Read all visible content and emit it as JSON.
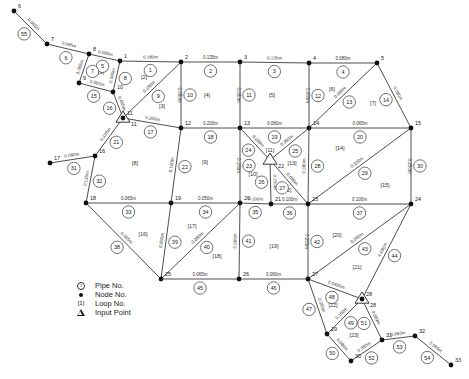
{
  "legend": {
    "pipe_no": "Pipe No.",
    "node_no": "Node No.",
    "loop_no": "Loop No.",
    "input_point": "Input Point",
    "pipe_symbol": "1",
    "loop_symbol": "[1]"
  },
  "nodes": [
    {
      "id": "1",
      "x": 120,
      "y": 61
    },
    {
      "id": "2",
      "x": 181,
      "y": 62
    },
    {
      "id": "3",
      "x": 240,
      "y": 62
    },
    {
      "id": "4",
      "x": 309,
      "y": 63
    },
    {
      "id": "5",
      "x": 377,
      "y": 63
    },
    {
      "id": "6",
      "x": 14,
      "y": 11
    },
    {
      "id": "7",
      "x": 47,
      "y": 44
    },
    {
      "id": "8",
      "x": 89,
      "y": 54
    },
    {
      "id": "9",
      "x": 79,
      "y": 83
    },
    {
      "id": "10",
      "x": 113,
      "y": 92
    },
    {
      "id": "11",
      "x": 123,
      "y": 118
    },
    {
      "id": "12",
      "x": 181,
      "y": 128
    },
    {
      "id": "13",
      "x": 240,
      "y": 128
    },
    {
      "id": "14",
      "x": 309,
      "y": 128
    },
    {
      "id": "15",
      "x": 411,
      "y": 128
    },
    {
      "id": "16",
      "x": 95,
      "y": 156
    },
    {
      "id": "17",
      "x": 50,
      "y": 163
    },
    {
      "id": "18",
      "x": 86,
      "y": 203
    },
    {
      "id": "19",
      "x": 171,
      "y": 203
    },
    {
      "id": "20",
      "x": 240,
      "y": 203
    },
    {
      "id": "21",
      "x": 271,
      "y": 204
    },
    {
      "id": "22",
      "x": 308,
      "y": 204
    },
    {
      "id": "23",
      "x": 308,
      "y": 204
    },
    {
      "id": "24",
      "x": 411,
      "y": 204
    },
    {
      "id": "25",
      "x": 161,
      "y": 279
    },
    {
      "id": "26",
      "x": 239,
      "y": 279
    },
    {
      "id": "27",
      "x": 308,
      "y": 279
    },
    {
      "id": "28",
      "x": 362,
      "y": 299
    },
    {
      "id": "29",
      "x": 327,
      "y": 334
    },
    {
      "id": "30",
      "x": 351,
      "y": 361
    },
    {
      "id": "31",
      "x": 382,
      "y": 340
    },
    {
      "id": "32",
      "x": 415,
      "y": 336
    },
    {
      "id": "33",
      "x": 451,
      "y": 365
    }
  ],
  "pipes": [
    {
      "no": "1",
      "dia": "0.180m",
      "from": "1",
      "to": "2"
    },
    {
      "no": "2",
      "dia": "0.135m",
      "from": "2",
      "to": "3"
    },
    {
      "no": "3",
      "dia": "0.135m",
      "from": "3",
      "to": "4"
    },
    {
      "no": "4",
      "dia": "0.080m",
      "from": "4",
      "to": "5"
    },
    {
      "no": "5",
      "dia": "0.080m",
      "from": "8",
      "to": "1"
    },
    {
      "no": "6",
      "dia": "0.065m",
      "from": "7",
      "to": "8"
    },
    {
      "no": "7",
      "dia": "0.065m",
      "from": "8",
      "to": "9"
    },
    {
      "no": "8",
      "dia": "0.065m",
      "from": "1",
      "to": "10"
    },
    {
      "no": "9",
      "dia": "0.180m",
      "from": "2",
      "to": "11"
    },
    {
      "no": "10",
      "dia": "0.080m",
      "from": "2",
      "to": "12"
    },
    {
      "no": "11",
      "dia": "0.080m",
      "from": "3",
      "to": "13"
    },
    {
      "no": "12",
      "dia": "0.080m",
      "from": "4",
      "to": "14"
    },
    {
      "no": "13",
      "dia": "0.080m",
      "from": "14",
      "to": "5"
    },
    {
      "no": "14",
      "dia": "0.080m",
      "from": "5",
      "to": "15"
    },
    {
      "no": "15",
      "dia": "0.065m",
      "from": "9",
      "to": "10"
    },
    {
      "no": "16",
      "dia": "0.065m",
      "from": "10",
      "to": "11"
    },
    {
      "no": "17",
      "dia": "0.200m",
      "from": "11",
      "to": "12"
    },
    {
      "no": "18",
      "dia": "0.200m",
      "from": "12",
      "to": "13"
    },
    {
      "no": "19",
      "dia": "0.080m",
      "from": "13",
      "to": "14"
    },
    {
      "no": "20",
      "dia": "0.065m",
      "from": "14",
      "to": "15"
    },
    {
      "no": "21",
      "dia": "0.135m",
      "from": "11",
      "to": "16"
    },
    {
      "no": "22",
      "dia": "0.100m",
      "from": "12",
      "to": "19"
    },
    {
      "no": "23",
      "dia": "0.150m",
      "from": "13",
      "to": "20"
    },
    {
      "no": "24",
      "dia": "0.200m",
      "from": "13",
      "to": "22"
    },
    {
      "no": "25",
      "dia": "0.080m",
      "from": "22",
      "to": "14"
    },
    {
      "no": "26",
      "dia": "0.200m",
      "from": "22",
      "to": "21"
    },
    {
      "no": "27",
      "dia": "0.080m",
      "from": "22",
      "to": "23"
    },
    {
      "no": "28",
      "dia": "0.080m",
      "from": "14",
      "to": "23"
    },
    {
      "no": "29",
      "dia": "0.100m",
      "from": "23",
      "to": "15"
    },
    {
      "no": "30",
      "dia": "0.250m",
      "from": "15",
      "to": "24"
    },
    {
      "no": "31",
      "dia": "0.080m",
      "from": "17",
      "to": "16"
    },
    {
      "no": "32",
      "dia": "0.135m",
      "from": "16",
      "to": "18"
    },
    {
      "no": "33",
      "dia": "0.065m",
      "from": "18",
      "to": "19"
    },
    {
      "no": "34",
      "dia": "0.050m",
      "from": "19",
      "to": "20"
    },
    {
      "no": "35",
      "dia": "0.100m",
      "from": "20",
      "to": "21"
    },
    {
      "no": "36",
      "dia": "0.100m",
      "from": "21",
      "to": "23"
    },
    {
      "no": "37",
      "dia": "0.100m",
      "from": "23",
      "to": "24"
    },
    {
      "no": "38",
      "dia": "0.065m",
      "from": "18",
      "to": "25"
    },
    {
      "no": "39",
      "dia": "0.065m",
      "from": "19",
      "to": "25"
    },
    {
      "no": "40",
      "dia": "0.080m",
      "from": "20",
      "to": "25"
    },
    {
      "no": "41",
      "dia": "0.065m",
      "from": "20",
      "to": "26"
    },
    {
      "no": "42",
      "dia": "0.250m",
      "from": "23",
      "to": "27"
    },
    {
      "no": "43",
      "dia": "0.080m",
      "from": "27",
      "to": "24"
    },
    {
      "no": "44",
      "dia": "0.080m",
      "from": "28",
      "to": "24"
    },
    {
      "no": "45",
      "dia": "0.065m",
      "from": "25",
      "to": "26"
    },
    {
      "no": "46",
      "dia": "0.080m",
      "from": "26",
      "to": "27"
    },
    {
      "no": "47",
      "dia": "0.080m",
      "from": "27",
      "to": "29"
    },
    {
      "no": "48",
      "dia": "0.0490m",
      "from": "27",
      "to": "28"
    },
    {
      "no": "49",
      "dia": "0.180m",
      "from": "29",
      "to": "28"
    },
    {
      "no": "50",
      "dia": "0.080m",
      "from": "29",
      "to": "30"
    },
    {
      "no": "51",
      "dia": "0.080m",
      "from": "28",
      "to": "31"
    },
    {
      "no": "52",
      "dia": "0.080m",
      "from": "30",
      "to": "31"
    },
    {
      "no": "53",
      "dia": "0.065m",
      "from": "31",
      "to": "32"
    },
    {
      "no": "54",
      "dia": "0.065m",
      "from": "32",
      "to": "33"
    },
    {
      "no": "55",
      "dia": "0.065m",
      "from": "6",
      "to": "7"
    }
  ],
  "loops": [
    {
      "id": "[1]",
      "x": 101,
      "y": 72
    },
    {
      "id": "[2]",
      "x": 144,
      "y": 77
    },
    {
      "id": "[3]",
      "x": 162,
      "y": 106
    },
    {
      "id": "[4]",
      "x": 207,
      "y": 95
    },
    {
      "id": "[5]",
      "x": 272,
      "y": 95
    },
    {
      "id": "[6]",
      "x": 332,
      "y": 89
    },
    {
      "id": "[7]",
      "x": 373,
      "y": 103
    },
    {
      "id": "[8]",
      "x": 135,
      "y": 163
    },
    {
      "id": "[9]",
      "x": 205,
      "y": 162
    },
    {
      "id": "[10]",
      "x": 253,
      "y": 174
    },
    {
      "id": "[11]",
      "x": 270,
      "y": 150
    },
    {
      "id": "[12]",
      "x": 287,
      "y": 190
    },
    {
      "id": "[13]",
      "x": 292,
      "y": 163
    },
    {
      "id": "[14]",
      "x": 340,
      "y": 148
    },
    {
      "id": "[15]",
      "x": 385,
      "y": 185
    },
    {
      "id": "[16]",
      "x": 143,
      "y": 234
    },
    {
      "id": "[17]",
      "x": 192,
      "y": 226
    },
    {
      "id": "[18]",
      "x": 217,
      "y": 256
    },
    {
      "id": "[19]",
      "x": 274,
      "y": 246
    },
    {
      "id": "[20]",
      "x": 337,
      "y": 235
    },
    {
      "id": "[21]",
      "x": 357,
      "y": 267
    },
    {
      "id": "[22]",
      "x": 333,
      "y": 305
    },
    {
      "id": "[23]",
      "x": 354,
      "y": 335
    }
  ],
  "input_points": [
    {
      "node": "11",
      "x": 123,
      "y": 118
    },
    {
      "node": "22",
      "x": 270,
      "y": 160
    },
    {
      "node": "28",
      "x": 362,
      "y": 299
    }
  ]
}
